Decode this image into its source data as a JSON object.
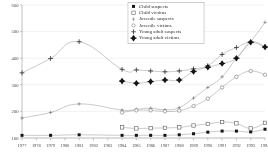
{
  "chart_data": {
    "type": "line",
    "title": "",
    "subtitle": "",
    "xlabel": "",
    "ylabel": "",
    "xlim": [
      1977,
      1994
    ],
    "ylim": [
      100,
      600
    ],
    "yticks": [
      100,
      200,
      300,
      400,
      500,
      600
    ],
    "grid": true,
    "legend_position": "top-center",
    "categories": [
      "1977",
      "1978",
      "1979",
      "1980",
      "1981",
      "1982",
      "1983",
      "1984",
      "1985",
      "1986",
      "1987",
      "1988",
      "1989",
      "1990",
      "1991",
      "1992",
      "1993",
      "1994"
    ],
    "series": [
      {
        "name": "Child suspects",
        "marker": "filled-square",
        "x": [
          1977,
          1979,
          1981,
          1984,
          1985,
          1986,
          1987,
          1988,
          1989,
          1990,
          1991,
          1992,
          1993,
          1994
        ],
        "values": [
          110,
          110,
          112,
          110,
          110,
          110,
          110,
          112,
          116,
          122,
          126,
          126,
          123,
          133
        ]
      },
      {
        "name": "Child victims",
        "marker": "open-square",
        "x": [
          1984,
          1985,
          1986,
          1987,
          1988,
          1989,
          1990,
          1991,
          1992,
          1993,
          1994
        ],
        "values": [
          140,
          136,
          137,
          138,
          140,
          147,
          153,
          160,
          155,
          136,
          157
        ]
      },
      {
        "name": "Juvenile suspects",
        "marker": "small-cross",
        "x": [
          1977,
          1979,
          1981,
          1984,
          1985,
          1986,
          1987,
          1988,
          1989,
          1990,
          1991,
          1992,
          1993,
          1994
        ],
        "values": [
          175,
          196,
          228,
          205,
          208,
          212,
          206,
          214,
          250,
          290,
          330,
          400,
          462,
          535
        ]
      },
      {
        "name": "Juvenile victims",
        "marker": "open-circle",
        "x": [
          1984,
          1985,
          1986,
          1987,
          1988,
          1989,
          1990,
          1991,
          1992,
          1993,
          1994
        ],
        "values": [
          196,
          204,
          204,
          200,
          203,
          220,
          248,
          290,
          330,
          352,
          338
        ]
      },
      {
        "name": "Young adult suspects",
        "marker": "plus",
        "x": [
          1977,
          1979,
          1981,
          1984,
          1985,
          1986,
          1987,
          1988,
          1989,
          1990,
          1991,
          1992,
          1993,
          1994
        ],
        "values": [
          345,
          399,
          462,
          358,
          356,
          352,
          349,
          352,
          360,
          372,
          414,
          440,
          460,
          442
        ]
      },
      {
        "name": "Young adult victims",
        "marker": "filled-diamond",
        "x": [
          1984,
          1985,
          1986,
          1987,
          1988,
          1989,
          1990,
          1991,
          1992,
          1993,
          1994
        ],
        "values": [
          314,
          306,
          312,
          318,
          318,
          350,
          366,
          380,
          400,
          460,
          442
        ]
      }
    ],
    "legend": [
      {
        "label": "Child suspects",
        "marker": "filled-square"
      },
      {
        "label": "Child victims",
        "marker": "open-square"
      },
      {
        "label": "Juvenile suspects",
        "marker": "small-cross"
      },
      {
        "label": "Juvenile victims",
        "marker": "open-circle"
      },
      {
        "label": "Young adult suspects",
        "marker": "plus"
      },
      {
        "label": "Young adult victims",
        "marker": "filled-diamond"
      }
    ],
    "colors": {
      "line": "#9c9c9c",
      "marker": "#1a1a1a",
      "grid": "#d8d8d8",
      "axis": "#8f8f8f",
      "text": "#4a4a4a"
    }
  }
}
